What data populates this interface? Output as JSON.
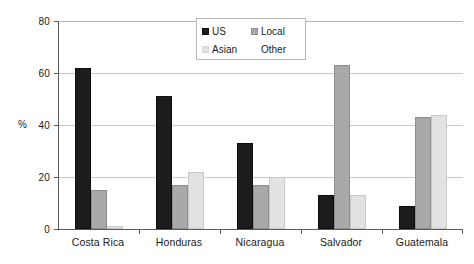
{
  "chart_data": {
    "type": "bar",
    "title": "",
    "subtitle": "",
    "xlabel": "",
    "ylabel": "%",
    "ylim": [
      0,
      80
    ],
    "yticks": [
      0,
      20,
      40,
      60,
      80
    ],
    "ytick_labels": [
      "0",
      "20",
      "40",
      "60",
      "80"
    ],
    "grid": "horizontal",
    "legend_position": "top-center",
    "categories": [
      "Costa Rica",
      "Honduras",
      "Nicaragua",
      "Salvador",
      "Guatemala"
    ],
    "series": [
      {
        "name": "US",
        "color": "#1c1c1c",
        "values": [
          62,
          51,
          33,
          13,
          9
        ]
      },
      {
        "name": "Local",
        "color": "#a9a9a9",
        "values": [
          15,
          17,
          17,
          63,
          43
        ]
      },
      {
        "name": "Asian",
        "color": "#e2e2e2",
        "values": [
          1,
          22,
          20,
          13,
          44
        ]
      },
      {
        "name": "Other",
        "color": "#ffffff",
        "values": [
          0,
          0,
          0,
          0,
          0
        ]
      }
    ]
  },
  "axes": {
    "y_axis_title": "%",
    "y_tick_labels": [
      "80",
      "60",
      "40",
      "20",
      "0"
    ],
    "x_tick_labels": [
      "Costa Rica",
      "Honduras",
      "Nicaragua",
      "Salvador",
      "Guatemala"
    ]
  },
  "legend": {
    "entries": [
      {
        "label": "US",
        "icon": "legend-swatch-black"
      },
      {
        "label": "Local",
        "icon": "legend-swatch-gray"
      },
      {
        "label": "Asian",
        "icon": "legend-swatch-light-gray"
      },
      {
        "label": "Other",
        "icon": "legend-swatch-white"
      }
    ]
  },
  "colors": {
    "us": "#1c1c1c",
    "local": "#a9a9a9",
    "asian": "#e2e2e2",
    "other": "#ffffff",
    "gridline": "#c8c8c8",
    "axis": "#5a5a5a",
    "background": "#ffffff",
    "text": "#1a1a1a"
  }
}
